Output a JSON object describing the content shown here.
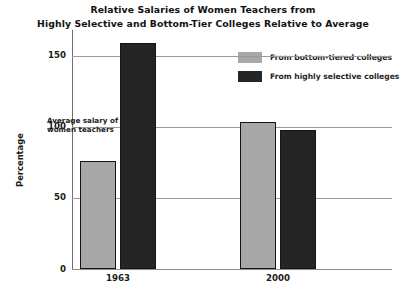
{
  "chart_data": {
    "type": "bar",
    "title": "Relative Salaries of Women Teachers from Highly Selective and Bottom-Tier Colleges Relative to Average",
    "title_lines": [
      "Relative Salaries of Women Teachers from",
      "Highly Selective and Bottom-Tier Colleges Relative to Average"
    ],
    "xlabel": "",
    "ylabel": "Percentage",
    "categories": [
      "1963",
      "2000"
    ],
    "ylim": [
      0,
      168
    ],
    "yticks": [
      0,
      50,
      100,
      150
    ],
    "ytick_labels": [
      "0",
      "50",
      "100",
      "150"
    ],
    "grid": true,
    "legend_position": "top-right",
    "series": [
      {
        "name": "From bottom-tiered colleges",
        "color": "#a8a8a8",
        "values": [
          76,
          103
        ]
      },
      {
        "name": "From highly selective colleges",
        "color": "#252525",
        "values": [
          159,
          98
        ]
      }
    ],
    "annotations": [
      {
        "text": "Average salary of women teachers",
        "lines": [
          "Average salary of",
          "women teachers"
        ],
        "value": 100
      }
    ]
  }
}
